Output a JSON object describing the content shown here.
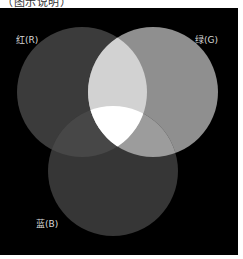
{
  "caption_fragment": "（图示说明）",
  "diagram": {
    "background": "#000000",
    "circles": [
      {
        "id": "red",
        "label": "红(R)",
        "cx": 82,
        "cy": 84,
        "r": 65,
        "fill": "#3b3b3b"
      },
      {
        "id": "green",
        "label": "绿(G)",
        "cx": 153,
        "cy": 84,
        "r": 65,
        "fill": "#8f8f8f"
      },
      {
        "id": "blue",
        "label": "蓝(B)",
        "cx": 113,
        "cy": 163,
        "r": 65,
        "fill": "#363636"
      }
    ],
    "overlaps": {
      "red_green": "#d2d2d2",
      "red_blue": "#474747",
      "green_blue": "#9c9c9c",
      "red_green_blue": "#ffffff"
    }
  }
}
